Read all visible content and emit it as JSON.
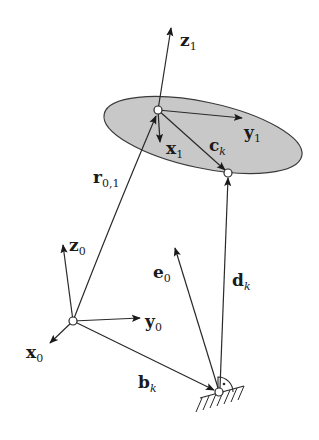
{
  "diagram": {
    "colors": {
      "line": "#2a2a2a",
      "platform_fill": "#c8c8c8",
      "node_fill": "#ffffff",
      "background": "#ffffff"
    },
    "labels": {
      "z1": {
        "main": "z",
        "sub": "1"
      },
      "y1": {
        "main": "y",
        "sub": "1"
      },
      "x1": {
        "main": "x",
        "sub": "1"
      },
      "ck": {
        "main": "c",
        "sub": "k"
      },
      "r01": {
        "main": "r",
        "sub": "0,1"
      },
      "z0": {
        "main": "z",
        "sub": "0"
      },
      "y0": {
        "main": "y",
        "sub": "0"
      },
      "x0": {
        "main": "x",
        "sub": "0"
      },
      "e0": {
        "main": "e",
        "sub": "0"
      },
      "dk": {
        "main": "d",
        "sub": "k"
      },
      "bk": {
        "main": "b",
        "sub": "k"
      }
    },
    "nodes": {
      "frame1_origin": {
        "x": 158,
        "y": 110
      },
      "platform_attachment": {
        "x": 228,
        "y": 173
      },
      "frame0_origin": {
        "x": 73,
        "y": 321
      },
      "base_joint": {
        "x": 219,
        "y": 392
      }
    }
  }
}
